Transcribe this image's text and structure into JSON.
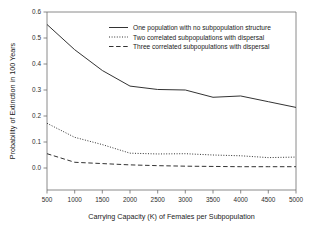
{
  "chart_data": {
    "type": "line",
    "title": "",
    "xlabel": "Carrying Capacity (K) of Females per Subpopulation",
    "ylabel": "Probability of Extinction in 100 Years",
    "x": [
      500,
      1000,
      1500,
      2000,
      2500,
      3000,
      3500,
      4000,
      4500,
      5000
    ],
    "xlim": [
      500,
      5000
    ],
    "ylim": [
      0.0,
      0.6
    ],
    "xticks": [
      500,
      1000,
      1500,
      2000,
      2500,
      3000,
      3500,
      4000,
      4500,
      5000
    ],
    "xtick_labels": [
      "500",
      "1000",
      "1500",
      "2000",
      "2500",
      "3000",
      "3500",
      "4000",
      "4500",
      "5000"
    ],
    "yticks": [
      0.0,
      0.1,
      0.2,
      0.3,
      0.4,
      0.5,
      0.6
    ],
    "ytick_labels": [
      "0.0",
      "0.1",
      "0.2",
      "0.3",
      "0.4",
      "0.5",
      "0.6"
    ],
    "grid": false,
    "legend_position": "top-center",
    "series": [
      {
        "name": "One population with no subpopulation structure",
        "style": "solid",
        "values": [
          0.552,
          0.455,
          0.375,
          0.315,
          0.302,
          0.3,
          0.272,
          0.277,
          0.255,
          0.233
        ]
      },
      {
        "name": "Two correlated subpopulations with dispersal",
        "style": "dotted",
        "values": [
          0.172,
          0.118,
          0.09,
          0.057,
          0.054,
          0.055,
          0.05,
          0.047,
          0.04,
          0.042
        ]
      },
      {
        "name": "Three correlated subpopulations with dispersal",
        "style": "dashed",
        "values": [
          0.055,
          0.022,
          0.017,
          0.012,
          0.009,
          0.007,
          0.006,
          0.005,
          0.005,
          0.005
        ]
      }
    ]
  },
  "legend": {
    "entries": [
      {
        "label": "One population with no subpopulation structure",
        "style": "solid"
      },
      {
        "label": "Two correlated subpopulations with dispersal",
        "style": "dotted"
      },
      {
        "label": "Three correlated subpopulations with dispersal",
        "style": "dashed"
      }
    ]
  },
  "axes": {
    "x_title": "Carrying Capacity (K) of Females per Subpopulation",
    "y_title": "Probability of Extinction in 100 Years"
  }
}
